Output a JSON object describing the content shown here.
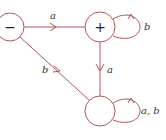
{
  "diagram": {
    "type": "finite-automaton",
    "color": "#b3545c",
    "states": [
      {
        "id": "minus",
        "label": "−",
        "role": "start"
      },
      {
        "id": "plus",
        "label": "+",
        "role": "final"
      },
      {
        "id": "trap",
        "label": "",
        "role": "dead"
      }
    ],
    "transitions": [
      {
        "from": "minus",
        "to": "plus",
        "label": "a"
      },
      {
        "from": "plus",
        "to": "plus",
        "label": "b"
      },
      {
        "from": "plus",
        "to": "trap",
        "label": "a"
      },
      {
        "from": "minus",
        "to": "trap",
        "label": "b"
      },
      {
        "from": "trap",
        "to": "trap",
        "label": "a, b"
      }
    ]
  }
}
